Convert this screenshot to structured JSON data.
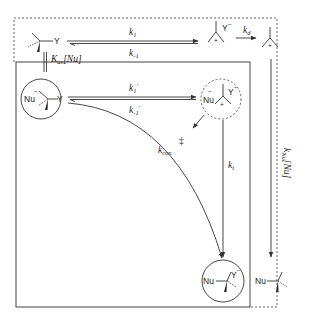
{
  "diagram": {
    "species": {
      "substrate": {
        "label": "Y",
        "description": "tetrahedral substrate R3C–Y"
      },
      "carbocation_ion_pair": {
        "cation_charge": "+",
        "anion": "Y",
        "anion_charge": "−"
      },
      "free_carbocation": {
        "charge": "+"
      },
      "preassociation_complex": {
        "nucleophile": "Nu",
        "nu_charge": "−",
        "leaving_group": "Y"
      },
      "intimate_ion_triple": {
        "nucleophile": "Nu",
        "nu_charge": "−",
        "cation_charge": "+",
        "anion": "Y",
        "anion_charge": "−"
      },
      "product_complex": {
        "nucleophile": "Nu",
        "anion": "Y",
        "anion_charge": "−"
      },
      "free_product": {
        "nucleophile": "Nu"
      }
    },
    "rate_constants": {
      "k1": {
        "main": "k",
        "sub": "1"
      },
      "k_minus1": {
        "main": "k",
        "sub": "-1"
      },
      "kd": {
        "main": "k",
        "sub": "d"
      },
      "k1_prime": {
        "main": "k",
        "sub": "1",
        "prime": "'"
      },
      "k_minus1_prime": {
        "main": "k",
        "sub": "-1",
        "prime": "'"
      },
      "k_con": {
        "main": "k",
        "sub": "con"
      },
      "kt": {
        "main": "k",
        "sub": "t"
      },
      "kNu": {
        "text": "k",
        "sub": "Nu",
        "bracket": "[Nu]"
      },
      "K_as": {
        "main": "K",
        "sub": "as",
        "bracket": "[Nu]"
      }
    },
    "transition_state_symbol": "‡",
    "colors": {
      "ink": "#333333",
      "background": "#ffffff"
    }
  }
}
